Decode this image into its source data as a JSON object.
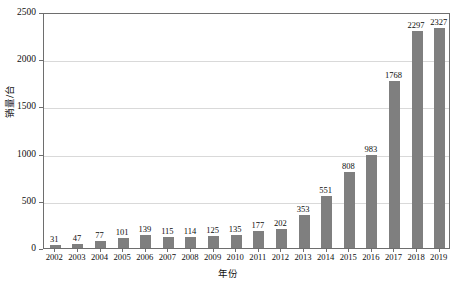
{
  "chart_data": {
    "type": "bar",
    "title": "",
    "xlabel": "年份",
    "ylabel": "销量/台",
    "categories": [
      "2002",
      "2003",
      "2004",
      "2005",
      "2006",
      "2007",
      "2008",
      "2009",
      "2010",
      "2011",
      "2012",
      "2013",
      "2014",
      "2015",
      "2016",
      "2017",
      "2018",
      "2019"
    ],
    "values": [
      31,
      47,
      77,
      101,
      139,
      115,
      114,
      125,
      135,
      177,
      202,
      353,
      551,
      808,
      983,
      1768,
      2297,
      2327
    ],
    "series": [
      {
        "name": "销量/台",
        "values": [
          31,
          47,
          77,
          101,
          139,
          115,
          114,
          125,
          135,
          177,
          202,
          353,
          551,
          808,
          983,
          1768,
          2297,
          2327
        ]
      }
    ],
    "ylim": [
      0,
      2500
    ],
    "yticks": [
      0,
      500,
      1000,
      1500,
      2000,
      2500
    ],
    "ytick_labels": [
      "0",
      "500",
      "1000",
      "1500",
      "2000",
      "2500"
    ],
    "grid": true,
    "grid_axis": "y",
    "legend": false,
    "legend_position": "none",
    "data_labels": true,
    "bar_color": "#7f7f7f",
    "axis_color": "#6e6e6e",
    "grid_color": "#d9d9d9",
    "background_color": "#ffffff"
  }
}
